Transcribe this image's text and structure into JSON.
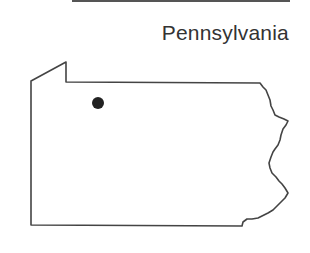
{
  "title": "Pennsylvania",
  "map": {
    "region": "Pennsylvania",
    "outline_color": "#444444",
    "marker": {
      "label": "location-marker",
      "cx": 98,
      "cy": 103,
      "r": 6,
      "color": "#222222"
    }
  }
}
